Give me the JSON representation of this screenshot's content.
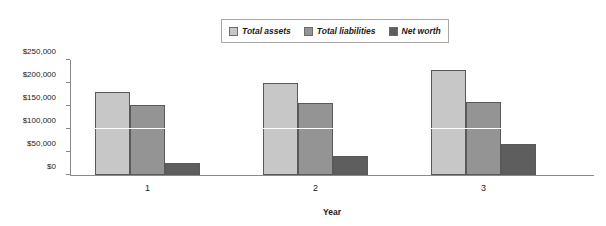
{
  "chart_data": {
    "type": "bar",
    "title": "",
    "subtitle": "",
    "xlabel": "Year",
    "ylabel": "",
    "categories": [
      "1",
      "2",
      "3"
    ],
    "series": [
      {
        "name": "Total assets",
        "color": "#c7c7c7",
        "values": [
          180000,
          200000,
          228000
        ]
      },
      {
        "name": "Total liabilities",
        "color": "#949494",
        "values": [
          153000,
          157000,
          159000
        ]
      },
      {
        "name": "Net worth",
        "color": "#5e5e5e",
        "values": [
          27000,
          42000,
          67000
        ]
      }
    ],
    "ylim": [
      0,
      250000
    ],
    "ytick_values": [
      0,
      50000,
      100000,
      150000,
      200000,
      250000
    ],
    "ytick_labels": [
      "$0",
      "$50,000",
      "$100,000",
      "$150,000",
      "$200,000",
      "$250,000"
    ],
    "gridlines": [
      100000
    ],
    "grid": true,
    "legend_position": "top-center",
    "annotations": []
  },
  "legend": {
    "entries": [
      {
        "label": "Total assets",
        "swatch_name": "legend-swatch-total-assets"
      },
      {
        "label": "Total liabilities",
        "swatch_name": "legend-swatch-total-liabilities"
      },
      {
        "label": "Net worth",
        "swatch_name": "legend-swatch-net-worth"
      }
    ]
  },
  "colors": {
    "total_assets": "#c7c7c7",
    "total_liabilities": "#949494",
    "net_worth": "#5e5e5e",
    "axis": "#8a8a8a",
    "bar_border": "#595959",
    "background": "#ffffff",
    "text": "#1a1a1a"
  }
}
